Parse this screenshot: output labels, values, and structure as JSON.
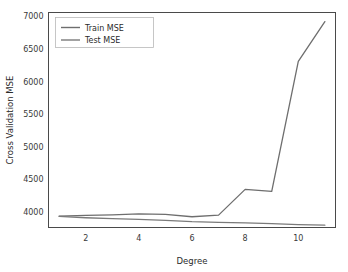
{
  "chart_data": {
    "type": "line",
    "title": "",
    "xlabel": "Degree",
    "ylabel": "Cross Validation MSE",
    "x": [
      1,
      2,
      3,
      4,
      5,
      6,
      7,
      8,
      9,
      10,
      11
    ],
    "xlim": [
      0.6,
      11.4
    ],
    "ylim": [
      3760,
      7060
    ],
    "xticks": [
      2,
      4,
      6,
      8,
      10
    ],
    "xticklabels": [
      "2",
      "4",
      "6",
      "8",
      "10"
    ],
    "yticks": [
      4000,
      4500,
      5000,
      5500,
      6000,
      6500,
      7000
    ],
    "yticklabels": [
      "4000",
      "4500",
      "5000",
      "5500",
      "6000",
      "6500",
      "7000"
    ],
    "grid": false,
    "legend_position": "upper left",
    "series": [
      {
        "name": "Train MSE",
        "color": "#6e6e6e",
        "values": [
          3935,
          3945,
          3955,
          3970,
          3960,
          3925,
          3950,
          4345,
          4315,
          6310,
          6920
        ]
      },
      {
        "name": "Test MSE",
        "color": "#7a7a7a",
        "values": [
          3930,
          3910,
          3895,
          3885,
          3870,
          3850,
          3840,
          3830,
          3820,
          3805,
          3795
        ]
      }
    ]
  },
  "axes": {
    "x_title": "Degree",
    "y_title": "Cross Validation MSE"
  },
  "legend": {
    "entries": [
      {
        "label": "Train MSE"
      },
      {
        "label": "Test MSE"
      }
    ]
  },
  "colors": {
    "background": "#ffffff",
    "spine": "#4a4a4a",
    "tick_text": "#3a3a3a",
    "series_1": "#6e6e6e",
    "series_2": "#7a7a7a"
  }
}
